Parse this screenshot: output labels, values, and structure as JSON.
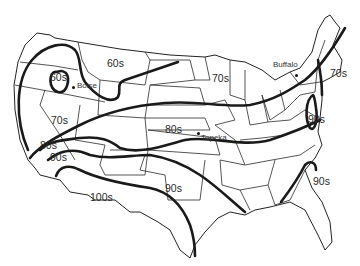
{
  "map": {
    "subject": "Contiguous United States temperature bands",
    "temperature_labels": [
      {
        "id": "boise-60s",
        "text": "60s",
        "x": 50,
        "y": 78
      },
      {
        "id": "montana-60s",
        "text": "60s",
        "x": 107,
        "y": 58
      },
      {
        "id": "midwest-70s",
        "text": "70s",
        "x": 212,
        "y": 73
      },
      {
        "id": "newengland-70s",
        "text": "70s",
        "x": 330,
        "y": 68
      },
      {
        "id": "nevada-70s",
        "text": "70s",
        "x": 51,
        "y": 115
      },
      {
        "id": "plains-80s",
        "text": "80s",
        "x": 165,
        "y": 124
      },
      {
        "id": "calif-80s",
        "text": "80s",
        "x": 40,
        "y": 142
      },
      {
        "id": "calif-90s",
        "text": "90s",
        "x": 50,
        "y": 152
      },
      {
        "id": "midatlantic-90s",
        "text": "90s",
        "x": 308,
        "y": 114
      },
      {
        "id": "southeast-90s",
        "text": "90s",
        "x": 313,
        "y": 176
      },
      {
        "id": "texas-90s",
        "text": "90s",
        "x": 165,
        "y": 183
      },
      {
        "id": "southwest-100s",
        "text": "100s",
        "x": 90,
        "y": 192
      }
    ],
    "cities": [
      {
        "name": "Boise",
        "dot_x": 72,
        "dot_y": 86,
        "label_x": 77,
        "label_y": 82
      },
      {
        "name": "Topeka",
        "dot_x": 197,
        "dot_y": 132,
        "label_x": 201,
        "label_y": 134
      },
      {
        "name": "Buffalo",
        "dot_x": 295,
        "dot_y": 74,
        "label_x": 273,
        "label_y": 61
      }
    ]
  }
}
